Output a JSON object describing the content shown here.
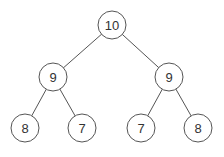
{
  "diagram": {
    "type": "binary-tree",
    "style": {
      "stroke": "#555555",
      "text": "#333333",
      "background": "#ffffff",
      "radius": 14
    },
    "nodes": [
      {
        "id": "n0",
        "label": "10",
        "x": 112,
        "y": 25
      },
      {
        "id": "n1",
        "label": "9",
        "x": 53,
        "y": 77
      },
      {
        "id": "n2",
        "label": "9",
        "x": 169,
        "y": 77
      },
      {
        "id": "n3",
        "label": "8",
        "x": 25,
        "y": 128
      },
      {
        "id": "n4",
        "label": "7",
        "x": 82,
        "y": 128
      },
      {
        "id": "n5",
        "label": "7",
        "x": 141,
        "y": 128
      },
      {
        "id": "n6",
        "label": "8",
        "x": 198,
        "y": 128
      }
    ],
    "edges": [
      {
        "from": "n0",
        "to": "n1"
      },
      {
        "from": "n0",
        "to": "n2"
      },
      {
        "from": "n1",
        "to": "n3"
      },
      {
        "from": "n1",
        "to": "n4"
      },
      {
        "from": "n2",
        "to": "n5"
      },
      {
        "from": "n2",
        "to": "n6"
      }
    ]
  }
}
